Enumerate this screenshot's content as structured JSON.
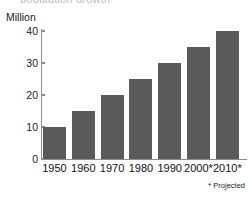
{
  "chart_data": {
    "type": "bar",
    "title": "",
    "xlabel": "",
    "ylabel": "Million",
    "categories": [
      "1950",
      "1960",
      "1970",
      "1980",
      "1990",
      "2000*",
      "2010*"
    ],
    "values": [
      10,
      15,
      20,
      25,
      30,
      35,
      40
    ],
    "ylim": [
      0,
      40
    ],
    "ytick_values": [
      0,
      10,
      20,
      30,
      40
    ],
    "ytick_labels": [
      "0",
      "10",
      "20",
      "30",
      "40"
    ],
    "grid": false,
    "legend": "none",
    "series": [
      {
        "name": "Population",
        "values": [
          10,
          15,
          20,
          25,
          30,
          35,
          40
        ]
      }
    ],
    "annotations": [
      {
        "name": "projected-footnote",
        "text": "* Projected"
      }
    ],
    "colors": {
      "bar": "#5a5a5a",
      "axis": "#8d8d8d",
      "text": "#1a1a1a",
      "background": "#ffffff"
    }
  },
  "axis": {
    "unit_label": "Million"
  },
  "footnote": {
    "text": "* Projected"
  },
  "title_clip": {
    "text": "population growth"
  }
}
